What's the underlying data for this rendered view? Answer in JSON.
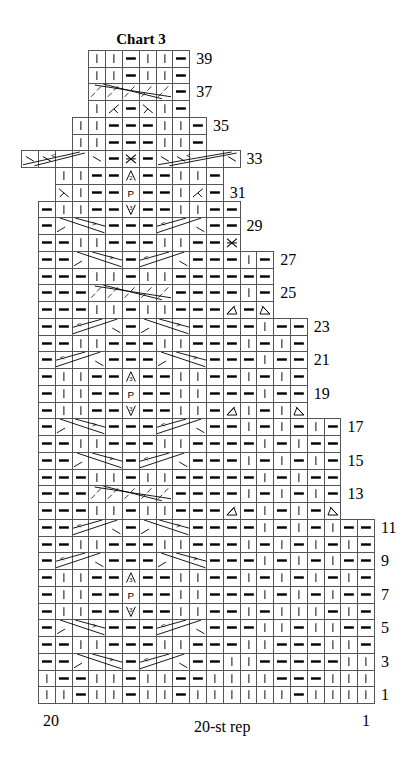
{
  "title": "Chart 3",
  "footer": {
    "left": "20",
    "center": "20-st rep",
    "right": "1"
  },
  "legend_codes": {
    "K": "knit (vertical bar)",
    "P": "purl (horizontal dash)",
    "X": "cross stitch",
    "D3": "3-st increase (triangle 3)",
    "D2": "2-st increase (triangle 2)",
    "V3": "3-st decrease (inverted V 3)",
    "Pp": "letter P",
    "DL": "left-leaning triangle decrease",
    "DR": "right-leaning triangle decrease",
    "RD": "right decrease",
    "LD": "left decrease",
    "BS": "backslash",
    "C": "cable-covered cell"
  },
  "chart_data": {
    "type": "table",
    "title": "Chart 3",
    "columns": 20,
    "rows_total": 39,
    "repeat_label": "20-st rep",
    "column_labels": {
      "left": "20",
      "right": "1"
    },
    "row_labels": [
      1,
      3,
      5,
      7,
      9,
      11,
      13,
      15,
      17,
      19,
      21,
      23,
      25,
      27,
      29,
      31,
      33,
      35,
      37,
      39
    ],
    "rows": [
      {
        "n": 1,
        "start": 0,
        "cells": [
          "K",
          "K",
          "P",
          "K",
          "K",
          "P",
          "K",
          "K",
          "P",
          "K",
          "K",
          "K",
          "K",
          "K",
          "K",
          "P",
          "K",
          "K",
          "K",
          "K"
        ],
        "cables": []
      },
      {
        "n": 2,
        "start": 0,
        "cells": [
          "K",
          "P",
          "P",
          "K",
          "K",
          "P",
          "K",
          "K",
          "P",
          "P",
          "K",
          "K",
          "K",
          "K",
          "P",
          "P",
          "P",
          "K",
          "K",
          "K"
        ],
        "cables": []
      },
      {
        "n": 3,
        "start": 0,
        "cells": [
          "P",
          "P",
          "C",
          "C",
          "C",
          "P",
          "C",
          "C",
          "C",
          "P",
          "P",
          "K",
          "K",
          "P",
          "P",
          "P",
          "P",
          "P",
          "K",
          "K"
        ],
        "cables": [
          {
            "s": 2,
            "len": 3,
            "dir": "R"
          },
          {
            "s": 6,
            "len": 3,
            "dir": "L"
          }
        ]
      },
      {
        "n": 4,
        "start": 0,
        "cells": [
          "P",
          "P",
          "K",
          "K",
          "P",
          "P",
          "P",
          "K",
          "K",
          "P",
          "P",
          "P",
          "K",
          "K",
          "P",
          "P",
          "P",
          "K",
          "K",
          "P"
        ],
        "cables": []
      },
      {
        "n": 5,
        "start": 0,
        "cells": [
          "P",
          "C",
          "C",
          "C",
          "P",
          "P",
          "P",
          "C",
          "C",
          "C",
          "P",
          "P",
          "P",
          "K",
          "K",
          "P",
          "K",
          "K",
          "P",
          "P"
        ],
        "cables": [
          {
            "s": 1,
            "len": 3,
            "dir": "R"
          },
          {
            "s": 7,
            "len": 3,
            "dir": "L"
          }
        ]
      },
      {
        "n": 6,
        "start": 0,
        "cells": [
          "P",
          "K",
          "K",
          "P",
          "P",
          "V3",
          "P",
          "P",
          "K",
          "K",
          "P",
          "P",
          "K",
          "P",
          "K",
          "K",
          "K",
          "P",
          "K",
          "P"
        ],
        "cables": []
      },
      {
        "n": 7,
        "start": 0,
        "cells": [
          "P",
          "K",
          "K",
          "P",
          "P",
          "Pp",
          "P",
          "P",
          "K",
          "K",
          "P",
          "P",
          "P",
          "K",
          "P",
          "K",
          "P",
          "K",
          "P",
          "P"
        ],
        "cables": []
      },
      {
        "n": 8,
        "start": 0,
        "cells": [
          "P",
          "K",
          "K",
          "P",
          "P",
          "D3",
          "P",
          "P",
          "K",
          "K",
          "P",
          "P",
          "K",
          "P",
          "K",
          "P",
          "K",
          "P",
          "K",
          "P"
        ],
        "cables": []
      },
      {
        "n": 9,
        "start": 0,
        "cells": [
          "P",
          "C",
          "C",
          "C",
          "P",
          "P",
          "P",
          "C",
          "C",
          "C",
          "P",
          "P",
          "P",
          "K",
          "P",
          "K",
          "P",
          "K",
          "P",
          "P"
        ],
        "cables": [
          {
            "s": 1,
            "len": 3,
            "dir": "L"
          },
          {
            "s": 7,
            "len": 3,
            "dir": "R"
          }
        ]
      },
      {
        "n": 10,
        "start": 0,
        "cells": [
          "P",
          "P",
          "K",
          "K",
          "P",
          "P",
          "P",
          "K",
          "K",
          "P",
          "P",
          "P",
          "K",
          "P",
          "K",
          "P",
          "K",
          "P",
          "K",
          "P"
        ],
        "cables": []
      },
      {
        "n": 11,
        "start": 0,
        "cells": [
          "P",
          "P",
          "C",
          "C",
          "C",
          "P",
          "C",
          "C",
          "C",
          "P",
          "P",
          "P",
          "P",
          "K",
          "P",
          "K",
          "P",
          "K",
          "P",
          "P"
        ],
        "cables": [
          {
            "s": 2,
            "len": 3,
            "dir": "L"
          },
          {
            "s": 6,
            "len": 3,
            "dir": "R"
          }
        ]
      },
      {
        "n": 12,
        "start": 0,
        "cells": [
          "P",
          "P",
          "P",
          "K",
          "K",
          "P",
          "K",
          "K",
          "P",
          "P",
          "P",
          "DL",
          "P",
          "K",
          "P",
          "K",
          "P",
          "DR"
        ],
        "cables": []
      },
      {
        "n": 13,
        "start": 0,
        "cells": [
          "P",
          "P",
          "P",
          "C",
          "C",
          "C",
          "C",
          "C",
          "P",
          "P",
          "P",
          "P",
          "K",
          "P",
          "K",
          "P",
          "K",
          "P"
        ],
        "cables": [
          {
            "s": 3,
            "len": 5,
            "dir": "LONG"
          }
        ]
      },
      {
        "n": 14,
        "start": 0,
        "cells": [
          "P",
          "P",
          "P",
          "K",
          "K",
          "P",
          "K",
          "K",
          "P",
          "P",
          "P",
          "P",
          "P",
          "K",
          "P",
          "K",
          "P",
          "P"
        ],
        "cables": []
      },
      {
        "n": 15,
        "start": 0,
        "cells": [
          "P",
          "P",
          "C",
          "C",
          "C",
          "P",
          "C",
          "C",
          "C",
          "P",
          "P",
          "P",
          "K",
          "P",
          "K",
          "P",
          "K",
          "P"
        ],
        "cables": [
          {
            "s": 2,
            "len": 3,
            "dir": "R"
          },
          {
            "s": 6,
            "len": 3,
            "dir": "L"
          }
        ]
      },
      {
        "n": 16,
        "start": 0,
        "cells": [
          "P",
          "P",
          "K",
          "K",
          "P",
          "P",
          "P",
          "K",
          "K",
          "P",
          "P",
          "P",
          "P",
          "K",
          "P",
          "K",
          "P",
          "P"
        ],
        "cables": []
      },
      {
        "n": 17,
        "start": 0,
        "cells": [
          "P",
          "C",
          "C",
          "C",
          "P",
          "P",
          "P",
          "C",
          "C",
          "C",
          "P",
          "P",
          "K",
          "P",
          "K",
          "P",
          "K",
          "P"
        ],
        "cables": [
          {
            "s": 1,
            "len": 3,
            "dir": "R"
          },
          {
            "s": 7,
            "len": 3,
            "dir": "L"
          }
        ]
      },
      {
        "n": 18,
        "start": 0,
        "cells": [
          "P",
          "K",
          "K",
          "P",
          "P",
          "V3",
          "P",
          "P",
          "K",
          "K",
          "P",
          "DL",
          "K",
          "P",
          "K",
          "DR"
        ],
        "cables": []
      },
      {
        "n": 19,
        "start": 0,
        "cells": [
          "P",
          "K",
          "K",
          "P",
          "P",
          "Pp",
          "P",
          "P",
          "K",
          "K",
          "P",
          "P",
          "P",
          "K",
          "P",
          "P"
        ],
        "cables": []
      },
      {
        "n": 20,
        "start": 0,
        "cells": [
          "P",
          "K",
          "K",
          "P",
          "P",
          "D3",
          "P",
          "P",
          "K",
          "K",
          "P",
          "P",
          "K",
          "P",
          "K",
          "P"
        ],
        "cables": []
      },
      {
        "n": 21,
        "start": 0,
        "cells": [
          "P",
          "C",
          "C",
          "C",
          "P",
          "P",
          "P",
          "C",
          "C",
          "C",
          "P",
          "P",
          "P",
          "K",
          "P",
          "P"
        ],
        "cables": [
          {
            "s": 1,
            "len": 3,
            "dir": "L"
          },
          {
            "s": 7,
            "len": 3,
            "dir": "R"
          }
        ]
      },
      {
        "n": 22,
        "start": 0,
        "cells": [
          "P",
          "P",
          "K",
          "K",
          "P",
          "P",
          "P",
          "K",
          "K",
          "P",
          "P",
          "P",
          "K",
          "P",
          "K",
          "P"
        ],
        "cables": []
      },
      {
        "n": 23,
        "start": 0,
        "cells": [
          "P",
          "P",
          "C",
          "C",
          "C",
          "P",
          "C",
          "C",
          "C",
          "P",
          "P",
          "P",
          "P",
          "K",
          "P",
          "P"
        ],
        "cables": [
          {
            "s": 2,
            "len": 3,
            "dir": "L"
          },
          {
            "s": 6,
            "len": 3,
            "dir": "R"
          }
        ]
      },
      {
        "n": 24,
        "start": 0,
        "cells": [
          "P",
          "P",
          "P",
          "K",
          "K",
          "P",
          "K",
          "K",
          "P",
          "P",
          "P",
          "DL",
          "P",
          "DR"
        ],
        "cables": []
      },
      {
        "n": 25,
        "start": 0,
        "cells": [
          "P",
          "P",
          "P",
          "C",
          "C",
          "C",
          "C",
          "C",
          "P",
          "P",
          "P",
          "P",
          "K",
          "P"
        ],
        "cables": [
          {
            "s": 3,
            "len": 5,
            "dir": "LONG"
          }
        ]
      },
      {
        "n": 26,
        "start": 0,
        "cells": [
          "P",
          "P",
          "P",
          "K",
          "K",
          "P",
          "K",
          "K",
          "P",
          "P",
          "P",
          "P",
          "P",
          "P"
        ],
        "cables": []
      },
      {
        "n": 27,
        "start": 0,
        "cells": [
          "P",
          "P",
          "C",
          "C",
          "C",
          "P",
          "C",
          "C",
          "C",
          "P",
          "P",
          "P",
          "K",
          "P"
        ],
        "cables": [
          {
            "s": 2,
            "len": 3,
            "dir": "R"
          },
          {
            "s": 6,
            "len": 3,
            "dir": "L"
          }
        ]
      },
      {
        "n": 28,
        "start": 0,
        "cells": [
          "P",
          "P",
          "K",
          "K",
          "P",
          "P",
          "P",
          "K",
          "K",
          "P",
          "P",
          "X"
        ],
        "cables": []
      },
      {
        "n": 29,
        "start": 0,
        "cells": [
          "P",
          "C",
          "C",
          "C",
          "P",
          "P",
          "P",
          "C",
          "C",
          "C",
          "P",
          "P"
        ],
        "cables": [
          {
            "s": 1,
            "len": 3,
            "dir": "R"
          },
          {
            "s": 7,
            "len": 3,
            "dir": "L"
          }
        ]
      },
      {
        "n": 30,
        "start": 0,
        "cells": [
          "P",
          "K",
          "K",
          "P",
          "P",
          "V3",
          "P",
          "P",
          "K",
          "K",
          "P",
          "P"
        ],
        "cables": []
      },
      {
        "n": 31,
        "start": 1,
        "cells": [
          "RD",
          "K",
          "P",
          "P",
          "Pp",
          "P",
          "P",
          "K",
          "LD",
          "P"
        ],
        "cables": []
      },
      {
        "n": 32,
        "start": 1,
        "cells": [
          "K",
          "K",
          "P",
          "P",
          "D2",
          "P",
          "P",
          "K",
          "K",
          "P"
        ],
        "cables": []
      },
      {
        "n": 33,
        "start": -1,
        "cells": [
          "BS",
          "BS",
          "C",
          "C",
          "BS",
          "P",
          "X",
          "P",
          "BS",
          "BS",
          "C",
          "C",
          "BS"
        ],
        "cables": [
          {
            "s": -1,
            "len": 4,
            "dir": "UPLONG"
          },
          {
            "s": 7,
            "len": 5,
            "dir": "UPLONG"
          }
        ]
      },
      {
        "n": 34,
        "start": 2,
        "cells": [
          "K",
          "K",
          "P",
          "P",
          "P",
          "K",
          "K",
          "P"
        ],
        "cables": []
      },
      {
        "n": 35,
        "start": 2,
        "cells": [
          "K",
          "K",
          "P",
          "P",
          "P",
          "K",
          "K",
          "P"
        ],
        "cables": []
      },
      {
        "n": 36,
        "start": 3,
        "cells": [
          "K",
          "LD",
          "P",
          "RD",
          "K",
          "P"
        ],
        "cables": []
      },
      {
        "n": 37,
        "start": 3,
        "cells": [
          "C",
          "C",
          "C",
          "C",
          "C",
          "P"
        ],
        "cables": [
          {
            "s": 3,
            "len": 5,
            "dir": "LONG"
          }
        ]
      },
      {
        "n": 38,
        "start": 3,
        "cells": [
          "K",
          "K",
          "P",
          "K",
          "K",
          "P"
        ],
        "cables": []
      },
      {
        "n": 39,
        "start": 3,
        "cells": [
          "K",
          "K",
          "P",
          "K",
          "K",
          "P"
        ],
        "cables": []
      }
    ]
  }
}
